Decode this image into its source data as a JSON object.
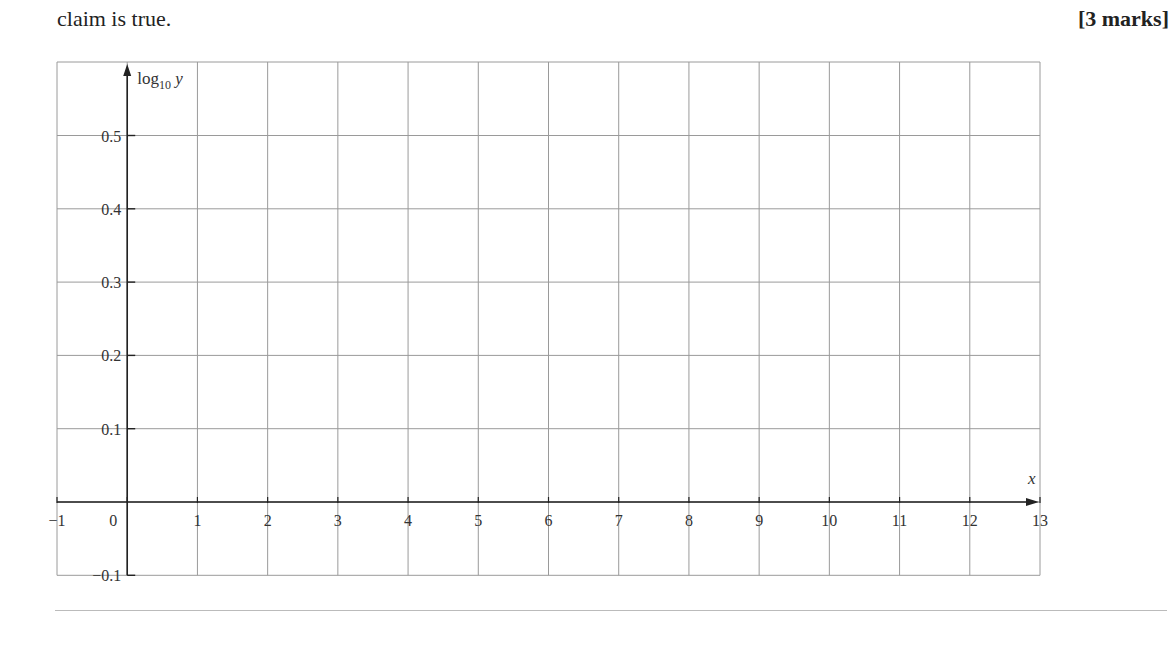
{
  "question": {
    "text": "claim is true.",
    "marks": "[3 marks]"
  },
  "chart_data": {
    "type": "line",
    "title": "",
    "xlabel": "x",
    "ylabel": "log10 y",
    "ylabel_main": "log",
    "ylabel_sub": "10",
    "ylabel_var": "y",
    "xlim": [
      -1,
      13
    ],
    "ylim": [
      -0.1,
      0.6
    ],
    "x_ticks": [
      "−1",
      "0",
      "1",
      "2",
      "3",
      "4",
      "5",
      "6",
      "7",
      "8",
      "9",
      "10",
      "11",
      "12",
      "13"
    ],
    "y_ticks": [
      "0.5",
      "0.4",
      "0.3",
      "0.2",
      "0.1",
      "−0.1"
    ],
    "grid": true,
    "series": []
  },
  "colors": {
    "grid": "#9a9a9a",
    "axis": "#222222",
    "rule": "#bbbbbb"
  }
}
